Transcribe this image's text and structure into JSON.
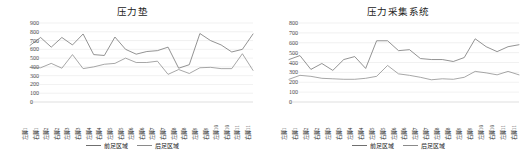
{
  "charts": [
    {
      "panel_name": "pressure-mat-chart",
      "title": "压力垫",
      "legend": [
        {
          "label": "前足区域",
          "color": "#6f6f6f"
        },
        {
          "label": "后足区域",
          "color": "#8a8a8a"
        }
      ]
    },
    {
      "panel_name": "pressure-acquisition-chart",
      "title": "压力采集系统",
      "legend": [
        {
          "label": "前足区域",
          "color": "#6f6f6f"
        },
        {
          "label": "后足区域",
          "color": "#8a8a8a"
        }
      ]
    }
  ],
  "chart_data": [
    {
      "type": "line",
      "title": "压力垫",
      "xlabel": "",
      "ylabel": "",
      "ylim": [
        0,
        900
      ],
      "yticks": [
        0,
        100,
        200,
        300,
        400,
        500,
        600,
        700,
        800,
        900
      ],
      "grid": true,
      "legend_position": "bottom",
      "categories": [
        "左脚1",
        "右脚1",
        "左脚2",
        "右脚2",
        "左脚3",
        "右脚3",
        "左脚4",
        "右脚4",
        "左脚5",
        "右脚5",
        "左脚6",
        "右脚6",
        "左脚7",
        "右脚7",
        "左脚8",
        "右脚8",
        "左脚9",
        "右脚9",
        "左脚10",
        "右脚10",
        "左脚11",
        "右脚11"
      ],
      "series": [
        {
          "name": "前足区域",
          "color": "#6f6f6f",
          "values": [
            645,
            735,
            625,
            735,
            650,
            775,
            540,
            530,
            740,
            600,
            545,
            575,
            585,
            625,
            385,
            425,
            780,
            700,
            650,
            570,
            600,
            775
          ]
        },
        {
          "name": "后足区域",
          "color": "#8a8a8a",
          "values": [
            395,
            390,
            440,
            385,
            540,
            380,
            400,
            430,
            440,
            500,
            450,
            450,
            465,
            315,
            370,
            325,
            390,
            395,
            380,
            380,
            550,
            360
          ]
        }
      ]
    },
    {
      "type": "line",
      "title": "压力采集系统",
      "xlabel": "",
      "ylabel": "",
      "ylim": [
        0,
        800
      ],
      "yticks": [
        0,
        100,
        200,
        300,
        400,
        500,
        600,
        700,
        800
      ],
      "grid": true,
      "legend_position": "bottom",
      "categories": [
        "左脚1",
        "右脚1",
        "左脚2",
        "右脚2",
        "左脚3",
        "右脚3",
        "左脚4",
        "右脚4",
        "左脚5",
        "右脚5",
        "左脚6",
        "右脚6",
        "左脚7",
        "右脚7",
        "左脚8",
        "右脚8",
        "左脚9",
        "右脚9",
        "左脚10",
        "右脚10",
        "左脚11",
        "右脚11"
      ],
      "series": [
        {
          "name": "前足区域",
          "color": "#6f6f6f",
          "values": [
            430,
            470,
            330,
            390,
            320,
            430,
            460,
            340,
            620,
            620,
            520,
            530,
            440,
            430,
            430,
            410,
            450,
            640,
            560,
            510,
            560,
            580
          ]
        },
        {
          "name": "后足区域",
          "color": "#8a8a8a",
          "values": [
            230,
            270,
            260,
            240,
            235,
            230,
            230,
            240,
            260,
            370,
            285,
            270,
            250,
            225,
            235,
            230,
            250,
            310,
            295,
            275,
            310,
            275
          ]
        }
      ]
    }
  ]
}
